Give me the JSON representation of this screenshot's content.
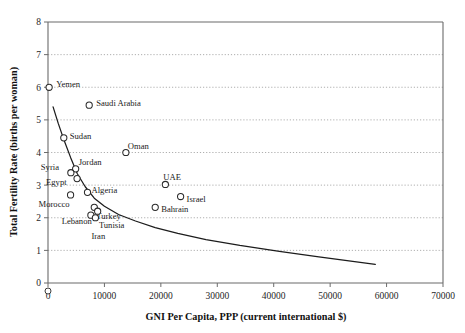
{
  "chart_data": {
    "type": "scatter",
    "title": "",
    "xlabel": "GNI Per Capita, PPP (current international $)",
    "ylabel": "Total Fertility Rate (births per woman)",
    "xlim": [
      0,
      70000
    ],
    "ylim": [
      0,
      8
    ],
    "xticks": [
      0,
      10000,
      20000,
      30000,
      40000,
      50000,
      60000,
      70000
    ],
    "yticks": [
      0,
      1,
      2,
      3,
      4,
      5,
      6,
      7,
      8
    ],
    "xtick_labels": [
      "0",
      "10000",
      "20000",
      "30000",
      "40000",
      "50000",
      "60000",
      "70000"
    ],
    "ytick_labels": [
      "0",
      "1",
      "2",
      "3",
      "4",
      "5",
      "6",
      "7",
      "8"
    ],
    "grid": "horizontal-dotted",
    "legend": "none",
    "marker_style": "open-circle",
    "points": [
      {
        "label": "Yemen",
        "x": 200,
        "y": 6.0,
        "label_dx": 7,
        "label_dy": -3
      },
      {
        "label": "Saudi Arabia",
        "x": 7300,
        "y": 5.45,
        "label_dx": 7,
        "label_dy": -2
      },
      {
        "label": "Sudan",
        "x": 2800,
        "y": 4.45,
        "label_dx": 6,
        "label_dy": -2
      },
      {
        "label": "Oman",
        "x": 13800,
        "y": 4.0,
        "label_dx": 2,
        "label_dy": -7
      },
      {
        "label": "Jordan",
        "x": 4900,
        "y": 3.5,
        "label_dx": 3,
        "label_dy": -7
      },
      {
        "label": "Syria",
        "x": 4050,
        "y": 3.38,
        "label_dx": -30,
        "label_dy": -6
      },
      {
        "label": "Egypt",
        "x": 5150,
        "y": 3.2,
        "label_dx": -31,
        "label_dy": 3
      },
      {
        "label": "Algeria",
        "x": 7000,
        "y": 2.78,
        "label_dx": 4,
        "label_dy": -2
      },
      {
        "label": "Morocco",
        "x": 4000,
        "y": 2.7,
        "label_dx": -32,
        "label_dy": 9
      },
      {
        "label": "UAE",
        "x": 20800,
        "y": 3.02,
        "label_dx": -2,
        "label_dy": -7
      },
      {
        "label": "Israel",
        "x": 23500,
        "y": 2.65,
        "label_dx": 6,
        "label_dy": 2
      },
      {
        "label": "Bahrain",
        "x": 19000,
        "y": 2.32,
        "label_dx": 6,
        "label_dy": 2
      },
      {
        "label": "Turkey",
        "x": 8200,
        "y": 2.32,
        "label_dx": 2,
        "label_dy": 9
      },
      {
        "label": "Lebanon",
        "x": 8800,
        "y": 2.2,
        "label_dx": -36,
        "label_dy": 10
      },
      {
        "label": "Tunisia",
        "x": 7600,
        "y": 2.08,
        "label_dx": 8,
        "label_dy": 10
      },
      {
        "label": "Iran",
        "x": 8400,
        "y": 2.0,
        "label_dx": -4,
        "label_dy": 18
      }
    ],
    "trend_curve": {
      "description": "fitted declining curve",
      "x": [
        900,
        1800,
        2900,
        4000,
        5200,
        6600,
        8200,
        10000,
        12500,
        15500,
        19000,
        23000,
        28000,
        34000,
        41000,
        48000,
        54000,
        58000
      ],
      "y": [
        5.4,
        4.9,
        4.35,
        3.85,
        3.35,
        2.95,
        2.6,
        2.35,
        2.1,
        1.9,
        1.7,
        1.52,
        1.33,
        1.15,
        0.97,
        0.8,
        0.66,
        0.57
      ]
    },
    "origin_legend_marker": {
      "present": true,
      "shape": "open-circle"
    }
  }
}
